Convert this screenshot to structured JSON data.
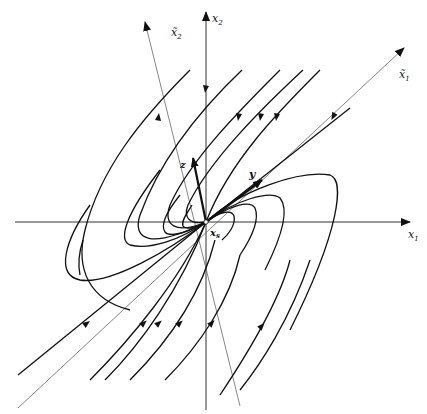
{
  "figure": {
    "type": "phase-portrait",
    "labels": {
      "x1": "x",
      "x1_sub": "1",
      "x2": "x",
      "x2_sub": "2",
      "x1_tilde": "x̃",
      "x1_tilde_sub": "1",
      "x2_tilde": "x̃",
      "x2_tilde_sub": "2",
      "eigen_y": "y",
      "eigen_z": "z",
      "equilibrium": "x",
      "equilibrium_sub": "s"
    },
    "colors": {
      "trajectory": "#111111",
      "axis": "#333333",
      "rotated_axis": "#666666"
    }
  }
}
